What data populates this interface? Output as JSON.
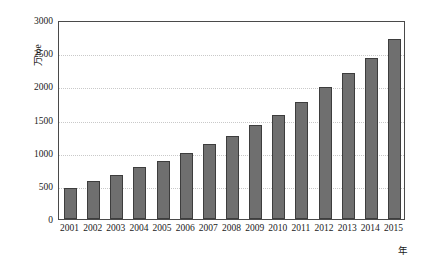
{
  "chart_data": {
    "type": "bar",
    "title": "",
    "subtitle": "",
    "xlabel": "年",
    "ylabel": "万toe",
    "categories": [
      "2001",
      "2002",
      "2003",
      "2004",
      "2005",
      "2006",
      "2007",
      "2008",
      "2009",
      "2010",
      "2011",
      "2012",
      "2013",
      "2014",
      "2015"
    ],
    "values": [
      470,
      575,
      665,
      780,
      875,
      1000,
      1130,
      1250,
      1410,
      1565,
      1765,
      1985,
      2195,
      2425,
      2710
    ],
    "ylim": [
      0,
      3000
    ],
    "yticks": [
      0,
      500,
      1000,
      1500,
      2000,
      2500,
      3000
    ],
    "ytick_labels": [
      "0",
      "500",
      "1000",
      "1500",
      "2000",
      "2500",
      "3000"
    ],
    "grid": "horizontal-dotted",
    "legend": "none",
    "series": [
      {
        "name": "",
        "values": [
          470,
          575,
          665,
          780,
          875,
          1000,
          1130,
          1250,
          1410,
          1565,
          1765,
          1985,
          2195,
          2425,
          2710
        ]
      }
    ],
    "colors": {
      "bar_fill": "#6f6f6f",
      "bar_border": "#3d3d3d",
      "gridline": "#c9c9c9",
      "axis": "#4a4a4a",
      "background": "#ffffff",
      "text": "#1a1a1a"
    }
  }
}
